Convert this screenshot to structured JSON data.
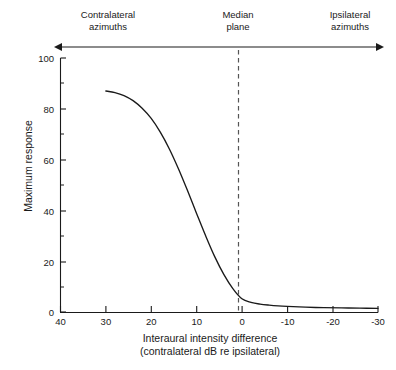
{
  "header": {
    "left_label": "Contralateral\nazimuths",
    "center_label": "Median\nplane",
    "right_label": "Ipsilateral\nazimuths",
    "arrow_name": "double-headed-arrow"
  },
  "chart_data": {
    "type": "line",
    "title": "",
    "xlabel": "Interaural intensity difference\n(contralateral dB re ipsilateral)",
    "xlabel_line1": "Interaural intensity difference",
    "xlabel_line2": "(contralateral dB re ipsilateral)",
    "ylabel": "Maximum response",
    "xlim": [
      40,
      -30
    ],
    "ylim": [
      0,
      100
    ],
    "x_reversed": true,
    "grid": false,
    "legend": null,
    "xticks": [
      40,
      30,
      20,
      10,
      0,
      -10,
      -20,
      -30
    ],
    "xticklabels": [
      "40",
      "30",
      "20",
      "10",
      "0",
      "-10",
      "-20",
      "-30"
    ],
    "yticks": [
      0,
      20,
      40,
      60,
      80,
      100
    ],
    "yticklabels": [
      "0",
      "20",
      "40",
      "60",
      "80",
      "100"
    ],
    "y_minor_ticks": [
      10,
      30,
      50,
      70,
      90
    ],
    "annotations": [
      {
        "name": "median-plane-line",
        "type": "vline",
        "x": 0,
        "style": "dashed"
      }
    ],
    "series": [
      {
        "name": "maximum response",
        "color": "#1a1a1a",
        "x": [
          30,
          28,
          26,
          24,
          22,
          20,
          18,
          16,
          14,
          12,
          10,
          8,
          6,
          4,
          2,
          0,
          -2,
          -4,
          -6,
          -8,
          -10,
          -14,
          -18,
          -22,
          -26,
          -30
        ],
        "y": [
          87,
          86.4,
          85.2,
          83.2,
          80.2,
          76.2,
          70.8,
          64.2,
          56.4,
          47.8,
          38.8,
          30.0,
          21.8,
          14.8,
          9.2,
          5.2,
          3.8,
          3.1,
          2.7,
          2.4,
          2.2,
          1.9,
          1.7,
          1.6,
          1.5,
          1.45
        ]
      }
    ]
  }
}
